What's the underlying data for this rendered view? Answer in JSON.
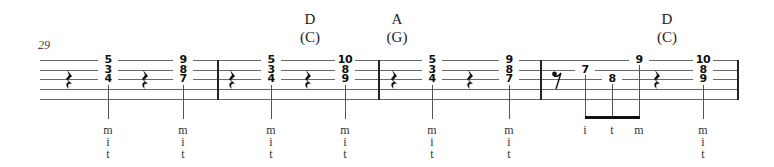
{
  "measure_number": "29",
  "staff": {
    "lines_y": [
      60,
      70,
      79,
      89,
      99
    ],
    "barlines_x": [
      217,
      378,
      540,
      737
    ]
  },
  "chord_names": [
    {
      "x": 310,
      "name": "D",
      "capo_name": "(C)"
    },
    {
      "x": 397,
      "name": "A",
      "capo_name": "(G)"
    },
    {
      "x": 667,
      "name": "D",
      "capo_name": "(C)"
    }
  ],
  "quarter_rests_x": [
    69,
    145,
    232,
    308,
    394,
    470,
    657
  ],
  "eighth_rests": [
    {
      "x": 557
    }
  ],
  "chords": [
    {
      "x": 108,
      "frets": [
        "5",
        "3",
        "4"
      ],
      "fingers": [
        "m",
        "i",
        "t"
      ]
    },
    {
      "x": 183,
      "frets": [
        "9",
        "8",
        "7"
      ],
      "fingers": [
        "m",
        "i",
        "t"
      ]
    },
    {
      "x": 271,
      "frets": [
        "5",
        "3",
        "4"
      ],
      "fingers": [
        "m",
        "i",
        "t"
      ]
    },
    {
      "x": 345,
      "frets": [
        "10",
        "8",
        "9"
      ],
      "fingers": [
        "m",
        "i",
        "t"
      ]
    },
    {
      "x": 432,
      "frets": [
        "5",
        "3",
        "4"
      ],
      "fingers": [
        "m",
        "i",
        "t"
      ]
    },
    {
      "x": 509,
      "frets": [
        "9",
        "8",
        "7"
      ],
      "fingers": [
        "m",
        "i",
        "t"
      ]
    },
    {
      "x": 703,
      "frets": [
        "10",
        "8",
        "9"
      ],
      "fingers": [
        "m",
        "i",
        "t"
      ]
    }
  ],
  "beamed_notes": [
    {
      "x": 585,
      "string": 2,
      "fret": "7",
      "finger": "i"
    },
    {
      "x": 612,
      "string": 3,
      "fret": "8",
      "finger": "t"
    },
    {
      "x": 639,
      "string": 1,
      "fret": "9",
      "finger": "m"
    }
  ]
}
